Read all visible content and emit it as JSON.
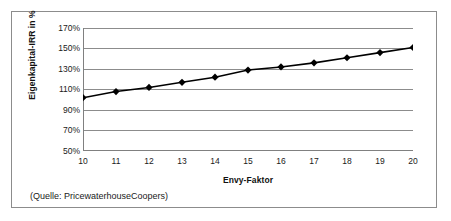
{
  "figure": {
    "source_note": "(Quelle: PricewaterhouseCoopers)",
    "border_color": "#8c8c8c",
    "background": "#ffffff"
  },
  "chart_data": {
    "type": "line",
    "title": "",
    "xlabel": "Envy-Faktor",
    "ylabel": "Eigenkapital-IRR in %",
    "x": [
      10,
      11,
      12,
      13,
      14,
      15,
      16,
      17,
      18,
      19,
      20
    ],
    "values": [
      102,
      108,
      112,
      117,
      122,
      129,
      132,
      136,
      141,
      146,
      151
    ],
    "series": [
      {
        "name": "Eigenkapital-IRR",
        "values": [
          102,
          108,
          112,
          117,
          122,
          129,
          132,
          136,
          141,
          146,
          151
        ]
      }
    ],
    "xlim": [
      10,
      20
    ],
    "ylim": [
      50,
      170
    ],
    "x_tick_labels": [
      "10",
      "11",
      "12",
      "13",
      "14",
      "15",
      "16",
      "17",
      "18",
      "19",
      "20"
    ],
    "y_tick_values": [
      170,
      150,
      130,
      110,
      90,
      70,
      50
    ],
    "y_tick_labels": [
      "170%",
      "150%",
      "130%",
      "110%",
      "90%",
      "70%",
      "50%"
    ],
    "grid": "horizontal",
    "legend": "none",
    "marker": "diamond",
    "line_color": "#000000",
    "marker_color": "#000000",
    "grid_color": "#808080"
  }
}
